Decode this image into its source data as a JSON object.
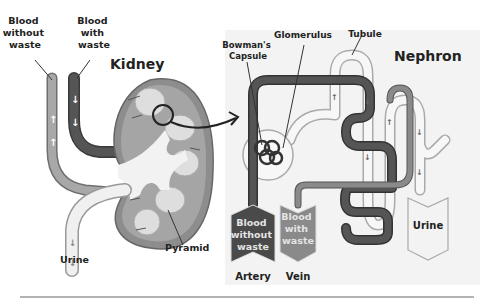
{
  "kidney": {
    "title": "Kidney",
    "labels": {
      "blood_without_waste": [
        "Blood",
        "without",
        "waste"
      ],
      "blood_with_waste": [
        "Blood",
        "with",
        "waste"
      ],
      "urine": "Urine",
      "pyramid": "Pyramid"
    }
  },
  "nephron": {
    "title": "Nephron",
    "labels": {
      "bowmans_capsule": [
        "Bowman's",
        "Capsule"
      ],
      "glomerulus": "Glomerulus",
      "tubule": "Tubule"
    },
    "outputs": {
      "artery": {
        "lines": [
          "Blood",
          "without",
          "waste"
        ],
        "caption": "Artery"
      },
      "vein": {
        "lines": [
          "Blood",
          "with",
          "waste"
        ],
        "caption": "Vein"
      },
      "urine": {
        "label": "Urine"
      }
    }
  },
  "colors": {
    "artery": "#555555",
    "vein": "#8a8a8a",
    "urine_tube": "#f0f0f0",
    "kidney_cortex": "#9a9a9a",
    "kidney_medulla": "#bdbdbd",
    "pyramid": "#dcdcdc",
    "panel_bg": "#f4f4f4"
  }
}
